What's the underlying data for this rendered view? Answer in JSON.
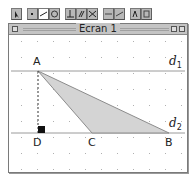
{
  "toolbar": {
    "groups": [
      {
        "tools": [
          {
            "icon": "pointer-icon"
          }
        ]
      },
      {
        "tools": [
          {
            "icon": "point-icon"
          },
          {
            "icon": "line-icon",
            "active": true
          },
          {
            "icon": "circle-icon"
          }
        ]
      },
      {
        "tools": [
          {
            "icon": "perpendicular-icon"
          },
          {
            "icon": "parallel-icon"
          },
          {
            "icon": "midpoint-icon"
          }
        ]
      },
      {
        "tools": [
          {
            "icon": "reflection-icon"
          },
          {
            "icon": "translation-icon"
          }
        ]
      },
      {
        "tools": [
          {
            "icon": "measure-icon"
          },
          {
            "icon": "display-icon"
          }
        ]
      }
    ]
  },
  "window": {
    "title": "Ecran 1"
  },
  "figure": {
    "points": {
      "A": {
        "label": "A",
        "x": 27,
        "y": 36
      },
      "B": {
        "label": "B",
        "x": 158,
        "y": 98
      },
      "C": {
        "label": "C",
        "x": 81,
        "y": 98
      },
      "D": {
        "label": "D",
        "x": 27,
        "y": 98
      }
    },
    "lines": {
      "d1": {
        "label": "d",
        "sub": "1",
        "y": 36
      },
      "d2": {
        "label": "d",
        "sub": "2",
        "y": 98
      }
    },
    "triangle": [
      "A",
      "B",
      "C"
    ],
    "perpendicular": {
      "from": "A",
      "to": "D",
      "style": "dashed",
      "right_angle_marker": true
    },
    "colors": {
      "triangle_fill": "#d4d4d4",
      "triangle_stroke": "#8c8c8c",
      "line_stroke": "#9a9a9a",
      "grid_dot": "#b0b0b0"
    },
    "grid_spacing": 16
  }
}
